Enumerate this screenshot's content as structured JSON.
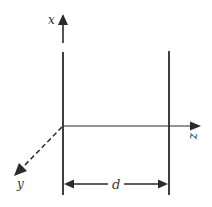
{
  "diagram": {
    "labels": {
      "x_axis": "x",
      "y_axis": "y",
      "z_axis": "z",
      "separation": "d"
    },
    "colors": {
      "line": "#2a2a2a",
      "background": "#ffffff"
    }
  }
}
